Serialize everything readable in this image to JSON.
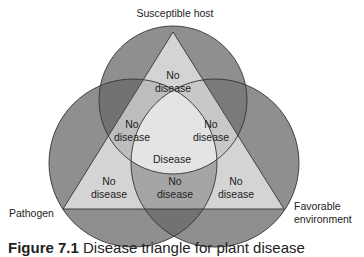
{
  "diagram": {
    "title": "Disease triangle",
    "colors": {
      "circle_fill": "#8c8c8c",
      "circle_overlap": "#6e6e6e",
      "triangle_fill": "#d0d0d0",
      "triangle_overlap": "#b5b5b5",
      "center_fill": "#e2e2e2",
      "stroke": "#333333",
      "background": "#ffffff"
    },
    "circles": [
      {
        "id": "host",
        "label": "Susceptible host"
      },
      {
        "id": "pathogen",
        "label": "Pathogen"
      },
      {
        "id": "environment",
        "label_line1": "Favorable",
        "label_line2": "environment"
      }
    ],
    "regions": [
      {
        "id": "host-only",
        "line1": "No",
        "line2": "disease"
      },
      {
        "id": "host-pathogen",
        "line1": "No",
        "line2": "disease"
      },
      {
        "id": "host-environment",
        "line1": "No",
        "line2": "disease"
      },
      {
        "id": "all-three",
        "line1": "Disease"
      },
      {
        "id": "pathogen-only",
        "line1": "No",
        "line2": "disease"
      },
      {
        "id": "pathogen-environment",
        "line1": "No",
        "line2": "disease"
      },
      {
        "id": "environment-only",
        "line1": "No",
        "line2": "disease"
      }
    ]
  },
  "caption": {
    "bold": "Figure 7.1",
    "text": "Disease triangle for plant disease"
  }
}
